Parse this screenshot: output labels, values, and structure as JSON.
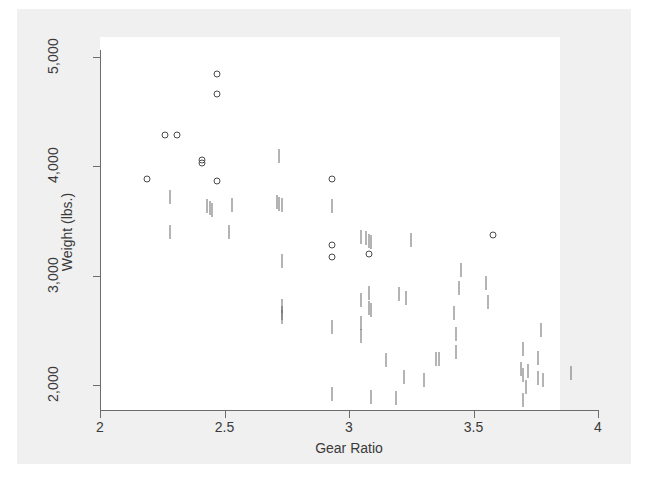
{
  "chart_data": {
    "type": "scatter",
    "title": "",
    "xlabel": "Gear Ratio",
    "ylabel": "Weight (lbs.)",
    "xlim": [
      2,
      4
    ],
    "ylim": [
      1700,
      5100
    ],
    "xticks": [
      2,
      2.5,
      3,
      3.5,
      4
    ],
    "xtick_labels": [
      "2",
      "2.5",
      "3",
      "3.5",
      "4"
    ],
    "yticks": [
      2000,
      3000,
      4000,
      5000
    ],
    "ytick_labels": [
      "2,000",
      "3,000",
      "4,000",
      "5,000"
    ],
    "grid": false,
    "legend": false,
    "marker_styles": [
      "circle",
      "tick"
    ],
    "series": [
      {
        "name": "circle-markers",
        "marker": "circle",
        "points": [
          {
            "x": 2.47,
            "y": 4840
          },
          {
            "x": 2.47,
            "y": 4660
          },
          {
            "x": 2.26,
            "y": 4290
          },
          {
            "x": 2.31,
            "y": 4290
          },
          {
            "x": 2.41,
            "y": 4060
          },
          {
            "x": 2.41,
            "y": 4030
          },
          {
            "x": 2.19,
            "y": 3880
          },
          {
            "x": 2.47,
            "y": 3870
          },
          {
            "x": 2.93,
            "y": 3880
          },
          {
            "x": 2.93,
            "y": 3280
          },
          {
            "x": 2.93,
            "y": 3170
          },
          {
            "x": 3.08,
            "y": 3200
          },
          {
            "x": 3.58,
            "y": 3370
          }
        ]
      },
      {
        "name": "tick-markers",
        "marker": "tick",
        "points": [
          {
            "x": 2.28,
            "y": 3720
          },
          {
            "x": 2.43,
            "y": 3640
          },
          {
            "x": 2.44,
            "y": 3620
          },
          {
            "x": 2.45,
            "y": 3600
          },
          {
            "x": 2.53,
            "y": 3650
          },
          {
            "x": 2.28,
            "y": 3400
          },
          {
            "x": 2.52,
            "y": 3400
          },
          {
            "x": 2.72,
            "y": 4090
          },
          {
            "x": 2.71,
            "y": 3670
          },
          {
            "x": 2.72,
            "y": 3660
          },
          {
            "x": 2.73,
            "y": 3650
          },
          {
            "x": 2.73,
            "y": 3130
          },
          {
            "x": 2.73,
            "y": 2720
          },
          {
            "x": 2.73,
            "y": 2660
          },
          {
            "x": 2.73,
            "y": 2620
          },
          {
            "x": 2.93,
            "y": 3640
          },
          {
            "x": 3.05,
            "y": 3350
          },
          {
            "x": 3.07,
            "y": 3340
          },
          {
            "x": 3.08,
            "y": 3320
          },
          {
            "x": 3.09,
            "y": 3310
          },
          {
            "x": 3.25,
            "y": 3330
          },
          {
            "x": 3.05,
            "y": 2780
          },
          {
            "x": 3.08,
            "y": 2840
          },
          {
            "x": 3.08,
            "y": 2700
          },
          {
            "x": 3.09,
            "y": 2690
          },
          {
            "x": 3.05,
            "y": 2570
          },
          {
            "x": 3.05,
            "y": 2450
          },
          {
            "x": 3.2,
            "y": 2830
          },
          {
            "x": 3.23,
            "y": 2800
          },
          {
            "x": 2.93,
            "y": 2530
          },
          {
            "x": 3.15,
            "y": 2230
          },
          {
            "x": 3.22,
            "y": 2070
          },
          {
            "x": 3.3,
            "y": 2050
          },
          {
            "x": 3.35,
            "y": 2240
          },
          {
            "x": 3.36,
            "y": 2240
          },
          {
            "x": 3.45,
            "y": 3050
          },
          {
            "x": 3.44,
            "y": 2890
          },
          {
            "x": 3.42,
            "y": 2660
          },
          {
            "x": 3.43,
            "y": 2470
          },
          {
            "x": 3.43,
            "y": 2300
          },
          {
            "x": 3.55,
            "y": 2930
          },
          {
            "x": 3.56,
            "y": 2760
          },
          {
            "x": 3.7,
            "y": 2330
          },
          {
            "x": 3.69,
            "y": 2150
          },
          {
            "x": 3.7,
            "y": 2090
          },
          {
            "x": 3.72,
            "y": 2130
          },
          {
            "x": 3.71,
            "y": 1980
          },
          {
            "x": 3.76,
            "y": 2250
          },
          {
            "x": 3.76,
            "y": 2060
          },
          {
            "x": 3.78,
            "y": 2050
          },
          {
            "x": 3.89,
            "y": 2110
          },
          {
            "x": 3.77,
            "y": 2500
          },
          {
            "x": 2.93,
            "y": 1920
          },
          {
            "x": 3.09,
            "y": 1890
          },
          {
            "x": 3.19,
            "y": 1880
          },
          {
            "x": 3.7,
            "y": 1860
          }
        ]
      }
    ]
  }
}
